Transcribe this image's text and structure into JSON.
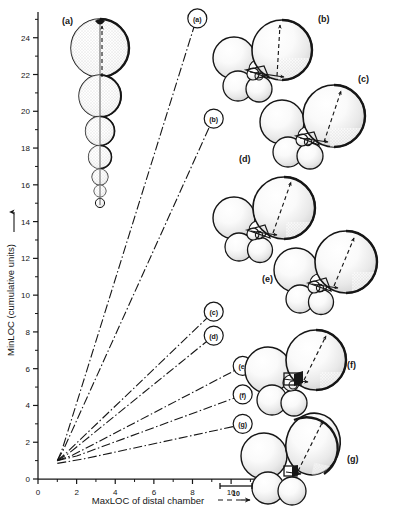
{
  "figure": {
    "kind": "scatter-line-with-morphology-diagrams",
    "background": "#ffffff",
    "ink": "#161616"
  },
  "chart_data": {
    "type": "line",
    "title": "",
    "subtitle": "",
    "xlabel": "MaxLOC of distal chamber",
    "xlabel_suffix_icon": "dashed-arrow",
    "ylabel": "MinLOC (cumulative units)",
    "ylabel_suffix_icon": "solid-arrow",
    "xlim": [
      0,
      11.6
    ],
    "ylim": [
      0,
      25.4
    ],
    "xticks_major": [
      0,
      2,
      4,
      6,
      8,
      10
    ],
    "xticks_major_labels": [
      "0",
      "2",
      "4",
      "6",
      "8",
      "10"
    ],
    "xticks_minor": [
      1,
      3,
      5,
      7,
      9,
      11
    ],
    "yticks_major": [
      0,
      2,
      4,
      6,
      8,
      10,
      12,
      14,
      16,
      18,
      20,
      22,
      24
    ],
    "yticks_major_labels": [
      "0",
      "2",
      "4",
      "6",
      "8",
      "10",
      "12",
      "14",
      "16",
      "18",
      "20",
      "22",
      "24"
    ],
    "yticks_minor": [
      1,
      3,
      5,
      7,
      9,
      11,
      13,
      15,
      17,
      19,
      21,
      23,
      25
    ],
    "grid": false,
    "legend_position": "inline-callout-labels",
    "line_style": "dash-dot",
    "series": [
      {
        "name": "(a)",
        "label": "(a)",
        "x": [
          1.0,
          1.25,
          8.2
        ],
        "y": [
          1.0,
          1.6,
          25.0
        ],
        "callout_label": "(a)",
        "callout_x": 8.25,
        "callout_y": 25.05
      },
      {
        "name": "(b)",
        "label": "(b)",
        "x": [
          1.0,
          1.3,
          9.05
        ],
        "y": [
          1.0,
          1.55,
          19.55
        ],
        "callout_label": "(b)",
        "callout_x": 9.1,
        "callout_y": 19.6
      },
      {
        "name": "(c)",
        "label": "(c)",
        "x": [
          1.0,
          1.5,
          9.05
        ],
        "y": [
          1.0,
          1.45,
          9.05
        ],
        "callout_label": "(c)",
        "callout_x": 9.1,
        "callout_y": 9.1
      },
      {
        "name": "(d)",
        "label": "(d)",
        "x": [
          1.0,
          1.6,
          9.05
        ],
        "y": [
          1.0,
          1.4,
          7.75
        ],
        "callout_label": "(d)",
        "callout_x": 9.1,
        "callout_y": 7.8
      },
      {
        "name": "(e)",
        "label": "(e)",
        "x": [
          1.0,
          1.8,
          10.55
        ],
        "y": [
          1.0,
          1.3,
          6.1
        ],
        "callout_label": "(e)",
        "callout_x": 10.6,
        "callout_y": 6.15
      },
      {
        "name": "(f)",
        "label": "(f)",
        "x": [
          1.0,
          2.0,
          10.55
        ],
        "y": [
          1.0,
          1.25,
          4.55
        ],
        "callout_label": "(f)",
        "callout_x": 10.6,
        "callout_y": 4.6
      },
      {
        "name": "(g)",
        "label": "(g)",
        "x": [
          1.0,
          2.4,
          10.55
        ],
        "y": [
          0.85,
          1.1,
          2.95
        ],
        "callout_label": "(g)",
        "callout_x": 10.6,
        "callout_y": 3.0
      }
    ]
  },
  "diagrams": [
    {
      "id": "a",
      "label": "(a)",
      "description": "uniserial-chain-of-chambers",
      "chamber_count": 7
    },
    {
      "id": "b",
      "label": "(b)",
      "description": "trochospiral-chamber-cluster",
      "chamber_count": 8
    },
    {
      "id": "c",
      "label": "(c)",
      "description": "trochospiral-chamber-cluster",
      "chamber_count": 8
    },
    {
      "id": "d",
      "label": "(d)",
      "description": "trochospiral-chamber-cluster",
      "chamber_count": 8
    },
    {
      "id": "e",
      "label": "(e)",
      "description": "trochospiral-chamber-cluster",
      "chamber_count": 8
    },
    {
      "id": "f",
      "label": "(f)",
      "description": "trochospiral-chamber-cluster",
      "chamber_count": 7
    },
    {
      "id": "g",
      "label": "(g)",
      "description": "trochospiral-chamber-cluster",
      "chamber_count": 6
    }
  ],
  "scalebar": {
    "label": "10"
  }
}
